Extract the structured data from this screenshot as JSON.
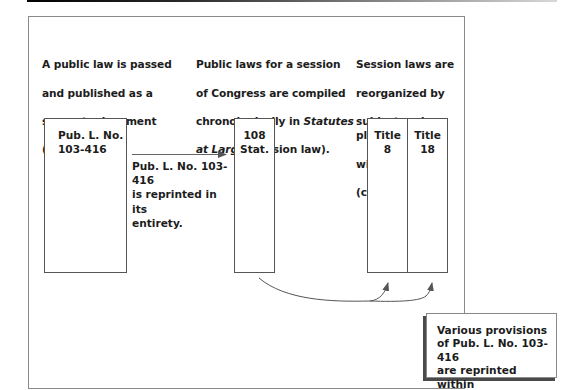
{
  "diagram": {
    "steps": [
      {
        "caption_lines": [
          "A public law is passed",
          "and published as a",
          "separate document",
          "(slip law)."
        ]
      },
      {
        "caption_line1": "Public laws for a session",
        "caption_line2": "of Congress are compiled",
        "caption_line3_pre": "chronologically in ",
        "caption_line3_italic": "Statutes",
        "caption_line4_italic": "at Large",
        "caption_line4_post": " (session law)."
      },
      {
        "caption_lines": [
          "Session laws are",
          "reorganized by",
          "subject and placed",
          "within the code",
          "(codified)."
        ]
      }
    ],
    "boxes": {
      "slip_law": [
        "Pub. L. No.",
        "103-416"
      ],
      "session_law": [
        "108",
        "Stat."
      ],
      "title_8": [
        "Title",
        "8"
      ],
      "title_18": [
        "Title",
        "18"
      ]
    },
    "arrow_caption": [
      "Pub. L. No. 103-416",
      "is reprinted in its",
      "entirety."
    ],
    "callout": [
      "Various provisions",
      "of Pub. L. No. 103-416",
      "are reprinted within",
      "the applicable Titles."
    ],
    "colors": {
      "box_border": "#555555",
      "frame_border": "#8a8a8a",
      "arrow": "#555555",
      "callout_shadow": "#4a4a4a",
      "text": "#1c1c1c"
    }
  }
}
